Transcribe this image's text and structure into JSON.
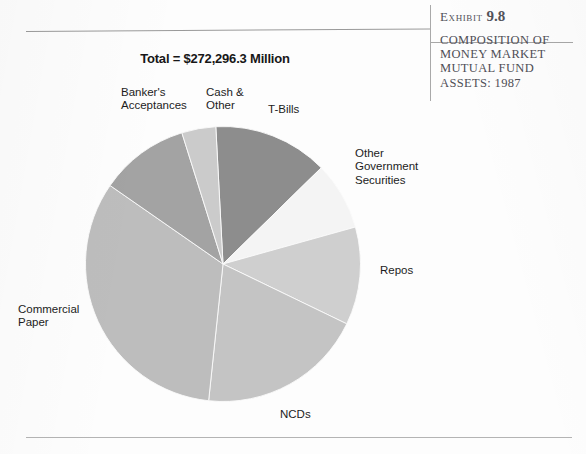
{
  "exhibit": {
    "eyebrow_word": "Exhibit",
    "eyebrow_number": "9.8",
    "title_lines": [
      "COMPOSITION OF",
      "MONEY MARKET",
      "MUTUAL FUND",
      "ASSETS: 1987"
    ]
  },
  "chart_title": "Total = $272,296.3 Million",
  "chart_data": {
    "type": "pie",
    "title": "Total = $272,296.3 Million",
    "subtitle": "Composition of Money Market Mutual Fund Assets: 1987",
    "total_label": "Total = $272,296.3 Million",
    "total_value": 272296.3,
    "units": "$ Million",
    "year": "1987",
    "legend": "labels placed outside slices with no legend box",
    "start_angle_deg": -3,
    "direction": "clockwise",
    "categories": [
      "T-Bills",
      "Other Government Securities",
      "Repos",
      "NCDs",
      "Commercial Paper",
      "Banker's Acceptances",
      "Cash & Other"
    ],
    "values": [
      13.5,
      8.0,
      11.5,
      19.5,
      33.0,
      10.5,
      4.0
    ],
    "value_unit": "percent",
    "colors": [
      "#8d8d8d",
      "#f4f4f4",
      "#cfcfcf",
      "#c4c4c4",
      "#bdbdbd",
      "#a3a3a3",
      "#cbcbcb"
    ],
    "slices": [
      {
        "label": "T-Bills",
        "percent": 13.5,
        "color": "#8d8d8d"
      },
      {
        "label": "Other Government Securities",
        "percent": 8.0,
        "color": "#f4f4f4"
      },
      {
        "label": "Repos",
        "percent": 11.5,
        "color": "#cfcfcf"
      },
      {
        "label": "NCDs",
        "percent": 19.5,
        "color": "#c4c4c4"
      },
      {
        "label": "Commercial Paper",
        "percent": 33.0,
        "color": "#bdbdbd"
      },
      {
        "label": "Banker's Acceptances",
        "percent": 10.5,
        "color": "#a3a3a3"
      },
      {
        "label": "Cash & Other",
        "percent": 4.0,
        "color": "#cbcbcb"
      }
    ]
  },
  "labels": {
    "bankers_line1": "Banker's",
    "bankers_line2": "Acceptances",
    "cash_line1": "Cash &",
    "cash_line2": "Other",
    "tbills": "T-Bills",
    "othergov_line1": "Other",
    "othergov_line2": "Government",
    "othergov_line3": "Securities",
    "repos": "Repos",
    "ncds": "NCDs",
    "commpaper_line1": "Commercial",
    "commpaper_line2": "Paper"
  }
}
